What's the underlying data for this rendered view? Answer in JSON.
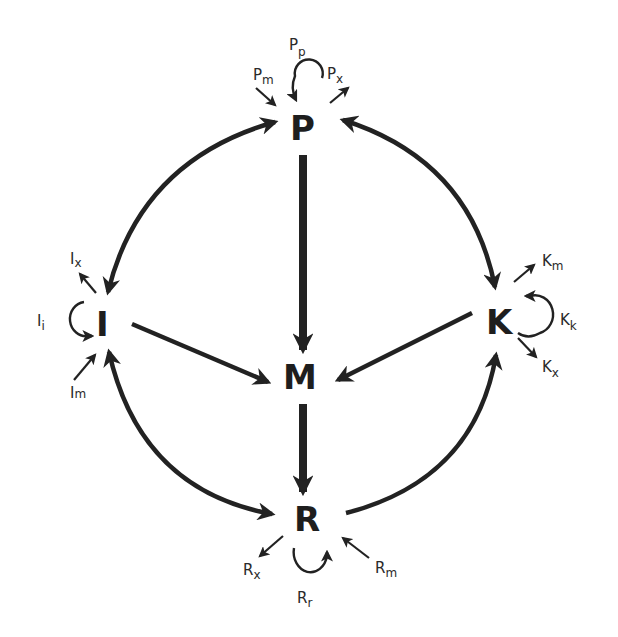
{
  "diagram": {
    "type": "compartment-flow-diagram",
    "nodes": [
      {
        "id": "P",
        "label": "P"
      },
      {
        "id": "I",
        "label": "I"
      },
      {
        "id": "K",
        "label": "K"
      },
      {
        "id": "M",
        "label": "M"
      },
      {
        "id": "R",
        "label": "R"
      }
    ],
    "flows": {
      "P": {
        "in": {
          "base": "P",
          "sub": "m"
        },
        "out": {
          "base": "P",
          "sub": "x"
        },
        "self": {
          "base": "P",
          "sub": "p"
        }
      },
      "I": {
        "in": {
          "base": "I",
          "sub": "m"
        },
        "out": {
          "base": "I",
          "sub": "x"
        },
        "self": {
          "base": "I",
          "sub": "i"
        }
      },
      "K": {
        "in": {
          "base": "K",
          "sub": "m"
        },
        "out": {
          "base": "K",
          "sub": "x"
        },
        "self": {
          "base": "K",
          "sub": "k"
        }
      },
      "R": {
        "in": {
          "base": "R",
          "sub": "m"
        },
        "out": {
          "base": "R",
          "sub": "x"
        },
        "self": {
          "base": "R",
          "sub": "r"
        }
      }
    },
    "edges": [
      {
        "from": "P",
        "to": "I",
        "bidirectional": true
      },
      {
        "from": "P",
        "to": "K",
        "bidirectional": true
      },
      {
        "from": "I",
        "to": "R",
        "bidirectional": true
      },
      {
        "from": "R",
        "to": "K",
        "bidirectional": false
      },
      {
        "from": "P",
        "to": "M",
        "bidirectional": false
      },
      {
        "from": "I",
        "to": "M",
        "bidirectional": false
      },
      {
        "from": "K",
        "to": "M",
        "bidirectional": false
      },
      {
        "from": "M",
        "to": "R",
        "bidirectional": false
      }
    ],
    "colors": {
      "ink": "#222222",
      "background": "#ffffff"
    }
  }
}
